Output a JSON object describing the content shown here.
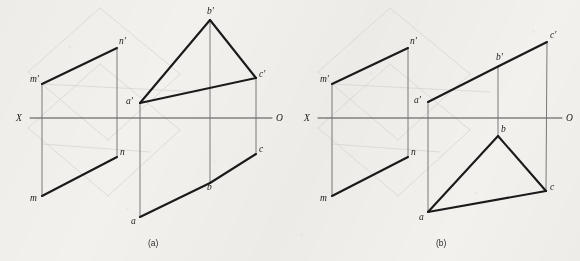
{
  "figure": {
    "title_caption_a": "(a)",
    "title_caption_b": "(b)",
    "background_color": "#f2f1ee",
    "ink_color": "#1a1a1a",
    "axis_color": "#4a4a4a",
    "projector_color": "#6b6b6b",
    "ghost_color": "#cfcdc8"
  },
  "panels": [
    {
      "id": "a",
      "caption": "(a)",
      "caption_pos": {
        "x": 148,
        "y": 246
      },
      "axis": {
        "name": "X-O ground line",
        "x1": 30,
        "y1": 118,
        "x2": 272,
        "y2": 118,
        "left_label": "X",
        "left_label_pos": {
          "x": 16,
          "y": 121
        },
        "right_label": "O",
        "right_label_pos": {
          "x": 276,
          "y": 121
        }
      },
      "points": [
        {
          "id": "m_prime",
          "label": "m'",
          "x": 42,
          "y": 84,
          "label_pos": {
            "x": 30,
            "y": 82
          }
        },
        {
          "id": "n_prime",
          "label": "n'",
          "x": 117,
          "y": 48,
          "label_pos": {
            "x": 119,
            "y": 44
          }
        },
        {
          "id": "m",
          "label": "m",
          "x": 42,
          "y": 196,
          "label_pos": {
            "x": 30,
            "y": 201
          }
        },
        {
          "id": "n",
          "label": "n",
          "x": 117,
          "y": 157,
          "label_pos": {
            "x": 120,
            "y": 155
          }
        },
        {
          "id": "a_prime",
          "label": "a'",
          "x": 140,
          "y": 103,
          "label_pos": {
            "x": 126,
            "y": 104
          }
        },
        {
          "id": "b_prime",
          "label": "b'",
          "x": 210,
          "y": 20,
          "label_pos": {
            "x": 207,
            "y": 14
          }
        },
        {
          "id": "c_prime",
          "label": "c'",
          "x": 256,
          "y": 78,
          "label_pos": {
            "x": 259,
            "y": 77
          }
        },
        {
          "id": "a",
          "label": "a",
          "x": 140,
          "y": 217,
          "label_pos": {
            "x": 131,
            "y": 224
          }
        },
        {
          "id": "b",
          "label": "b",
          "x": 210,
          "y": 183,
          "label_pos": {
            "x": 207,
            "y": 190
          }
        },
        {
          "id": "c",
          "label": "c",
          "x": 256,
          "y": 154,
          "label_pos": {
            "x": 259,
            "y": 152
          }
        }
      ],
      "heavy_edges": [
        {
          "name": "edge-m-prime-n-prime",
          "x1": 42,
          "y1": 84,
          "x2": 117,
          "y2": 48
        },
        {
          "name": "edge-m-n",
          "x1": 42,
          "y1": 196,
          "x2": 117,
          "y2": 157
        },
        {
          "name": "edge-a-prime-b-prime",
          "x1": 140,
          "y1": 103,
          "x2": 210,
          "y2": 20
        },
        {
          "name": "edge-b-prime-c-prime",
          "x1": 210,
          "y1": 20,
          "x2": 256,
          "y2": 78
        },
        {
          "name": "edge-a-prime-c-prime",
          "x1": 140,
          "y1": 103,
          "x2": 256,
          "y2": 78
        },
        {
          "name": "edge-a-b",
          "x1": 140,
          "y1": 217,
          "x2": 210,
          "y2": 183
        },
        {
          "name": "edge-b-c",
          "x1": 210,
          "y1": 183,
          "x2": 256,
          "y2": 154
        }
      ],
      "projectors": [
        {
          "name": "projector-m",
          "x1": 42,
          "y1": 84,
          "x2": 42,
          "y2": 196
        },
        {
          "name": "projector-n",
          "x1": 117,
          "y1": 48,
          "x2": 117,
          "y2": 157
        },
        {
          "name": "projector-a",
          "x1": 140,
          "y1": 103,
          "x2": 140,
          "y2": 217
        },
        {
          "name": "projector-b",
          "x1": 210,
          "y1": 20,
          "x2": 210,
          "y2": 183
        },
        {
          "name": "projector-c",
          "x1": 256,
          "y1": 78,
          "x2": 256,
          "y2": 154
        }
      ],
      "ghost_lines": [
        {
          "name": "ghost-plane-1",
          "x1": 28,
          "y1": 72,
          "x2": 100,
          "y2": 8
        },
        {
          "name": "ghost-plane-2",
          "x1": 100,
          "y1": 8,
          "x2": 180,
          "y2": 74
        },
        {
          "name": "ghost-plane-3",
          "x1": 180,
          "y1": 74,
          "x2": 108,
          "y2": 140
        },
        {
          "name": "ghost-plane-4",
          "x1": 108,
          "y1": 140,
          "x2": 28,
          "y2": 72
        },
        {
          "name": "ghost-plane-5",
          "x1": 28,
          "y1": 128,
          "x2": 100,
          "y2": 64
        },
        {
          "name": "ghost-plane-6",
          "x1": 100,
          "y1": 64,
          "x2": 180,
          "y2": 130
        },
        {
          "name": "ghost-plane-7",
          "x1": 180,
          "y1": 130,
          "x2": 108,
          "y2": 196
        },
        {
          "name": "ghost-plane-8",
          "x1": 108,
          "y1": 196,
          "x2": 28,
          "y2": 128
        },
        {
          "name": "ghost-diag-1",
          "x1": 42,
          "y1": 84,
          "x2": 200,
          "y2": 92
        },
        {
          "name": "ghost-diag-2",
          "x1": 42,
          "y1": 144,
          "x2": 150,
          "y2": 152
        }
      ]
    },
    {
      "id": "b",
      "caption": "(b)",
      "caption_pos": {
        "x": 436,
        "y": 246
      },
      "axis": {
        "name": "X-O ground line",
        "x1": 318,
        "y1": 118,
        "x2": 562,
        "y2": 118,
        "left_label": "X",
        "left_label_pos": {
          "x": 304,
          "y": 121
        },
        "right_label": "O",
        "right_label_pos": {
          "x": 566,
          "y": 121
        }
      },
      "points": [
        {
          "id": "m_prime",
          "label": "m'",
          "x": 332,
          "y": 84,
          "label_pos": {
            "x": 320,
            "y": 82
          }
        },
        {
          "id": "n_prime",
          "label": "n'",
          "x": 408,
          "y": 48,
          "label_pos": {
            "x": 410,
            "y": 44
          }
        },
        {
          "id": "m",
          "label": "m",
          "x": 332,
          "y": 196,
          "label_pos": {
            "x": 320,
            "y": 201
          }
        },
        {
          "id": "n",
          "label": "n",
          "x": 408,
          "y": 157,
          "label_pos": {
            "x": 411,
            "y": 155
          }
        },
        {
          "id": "a_prime",
          "label": "a'",
          "x": 428,
          "y": 102,
          "label_pos": {
            "x": 414,
            "y": 103
          }
        },
        {
          "id": "b_prime",
          "label": "b'",
          "x": 499,
          "y": 66,
          "label_pos": {
            "x": 496,
            "y": 60
          }
        },
        {
          "id": "c_prime",
          "label": "c'",
          "x": 547,
          "y": 42,
          "label_pos": {
            "x": 550,
            "y": 38
          }
        },
        {
          "id": "a",
          "label": "a",
          "x": 428,
          "y": 212,
          "label_pos": {
            "x": 419,
            "y": 220
          }
        },
        {
          "id": "b",
          "label": "b",
          "x": 498,
          "y": 136,
          "label_pos": {
            "x": 501,
            "y": 132
          }
        },
        {
          "id": "c",
          "label": "c",
          "x": 546,
          "y": 191,
          "label_pos": {
            "x": 550,
            "y": 190
          }
        }
      ],
      "heavy_edges": [
        {
          "name": "edge-m-prime-n-prime",
          "x1": 332,
          "y1": 84,
          "x2": 408,
          "y2": 48
        },
        {
          "name": "edge-m-n",
          "x1": 332,
          "y1": 196,
          "x2": 408,
          "y2": 157
        },
        {
          "name": "edge-a-prime-b-prime",
          "x1": 428,
          "y1": 102,
          "x2": 499,
          "y2": 66
        },
        {
          "name": "edge-b-prime-c-prime",
          "x1": 499,
          "y1": 66,
          "x2": 547,
          "y2": 42
        },
        {
          "name": "edge-a-b",
          "x1": 428,
          "y1": 212,
          "x2": 498,
          "y2": 136
        },
        {
          "name": "edge-b-c",
          "x1": 498,
          "y1": 136,
          "x2": 546,
          "y2": 191
        },
        {
          "name": "edge-a-c",
          "x1": 428,
          "y1": 212,
          "x2": 546,
          "y2": 191
        }
      ],
      "projectors": [
        {
          "name": "projector-m",
          "x1": 332,
          "y1": 84,
          "x2": 332,
          "y2": 196
        },
        {
          "name": "projector-n",
          "x1": 408,
          "y1": 48,
          "x2": 408,
          "y2": 157
        },
        {
          "name": "projector-a",
          "x1": 428,
          "y1": 102,
          "x2": 428,
          "y2": 212
        },
        {
          "name": "projector-b",
          "x1": 498,
          "y1": 66,
          "x2": 498,
          "y2": 136
        },
        {
          "name": "projector-c",
          "x1": 547,
          "y1": 42,
          "x2": 546,
          "y2": 191
        }
      ],
      "ghost_lines": [
        {
          "name": "ghost-plane-1",
          "x1": 318,
          "y1": 72,
          "x2": 390,
          "y2": 8
        },
        {
          "name": "ghost-plane-2",
          "x1": 390,
          "y1": 8,
          "x2": 470,
          "y2": 74
        },
        {
          "name": "ghost-plane-3",
          "x1": 470,
          "y1": 74,
          "x2": 398,
          "y2": 140
        },
        {
          "name": "ghost-plane-4",
          "x1": 398,
          "y1": 140,
          "x2": 318,
          "y2": 72
        },
        {
          "name": "ghost-plane-5",
          "x1": 318,
          "y1": 128,
          "x2": 390,
          "y2": 64
        },
        {
          "name": "ghost-plane-6",
          "x1": 390,
          "y1": 64,
          "x2": 470,
          "y2": 130
        },
        {
          "name": "ghost-plane-7",
          "x1": 470,
          "y1": 130,
          "x2": 398,
          "y2": 196
        },
        {
          "name": "ghost-plane-8",
          "x1": 398,
          "y1": 196,
          "x2": 318,
          "y2": 128
        },
        {
          "name": "ghost-diag-1",
          "x1": 332,
          "y1": 84,
          "x2": 490,
          "y2": 92
        },
        {
          "name": "ghost-diag-2",
          "x1": 332,
          "y1": 144,
          "x2": 440,
          "y2": 152
        }
      ]
    }
  ]
}
